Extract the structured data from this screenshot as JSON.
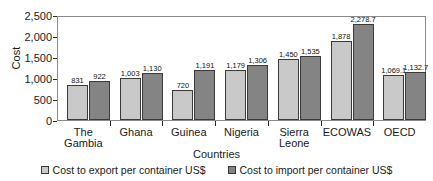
{
  "chart_data": {
    "type": "bar",
    "title": "",
    "xlabel": "Countries",
    "ylabel": "Cost",
    "ylim": [
      0,
      2500
    ],
    "yticks": [
      "0",
      "500",
      "1,000",
      "1,500",
      "2,000",
      "2,500"
    ],
    "ytick_values": [
      0,
      500,
      1000,
      1500,
      2000,
      2500
    ],
    "grid": false,
    "legend_position": "bottom",
    "categories": [
      "The Gambia",
      "Ghana",
      "Guinea",
      "Nigeria",
      "Sierra Leone",
      "ECOWAS",
      "OECD"
    ],
    "series": [
      {
        "name": "Cost to export per container US$",
        "color": "#c9c9c9",
        "values": [
          831,
          1003,
          720,
          1179,
          1450,
          1878,
          1069.1
        ],
        "labels": [
          "831",
          "1,003",
          "720",
          "1,179",
          "1,450",
          "1,878",
          "1,069.1"
        ]
      },
      {
        "name": "Cost to import per container US$",
        "color": "#848484",
        "values": [
          922,
          1130,
          1191,
          1306,
          1535,
          2278.7,
          1132.7
        ],
        "labels": [
          "922",
          "1,130",
          "1,191",
          "1,306",
          "1,535",
          "2,278.7",
          "1,132.7"
        ]
      }
    ]
  }
}
